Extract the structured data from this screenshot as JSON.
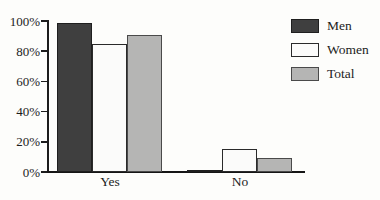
{
  "background_color": "#fdfdfb",
  "text_color": "#1c1c1c",
  "axis_color": "#1c1c1c",
  "chart_data": {
    "type": "bar",
    "title": "",
    "xlabel": "",
    "ylabel": "",
    "categories": [
      "Yes",
      "No"
    ],
    "series": [
      {
        "name": "Men",
        "values": [
          99,
          1
        ],
        "fill": "#3f3f3f",
        "border": "#1f1f1f"
      },
      {
        "name": "Women",
        "values": [
          85,
          15
        ],
        "fill": "#fbfbfa",
        "border": "#2a2a2a"
      },
      {
        "name": "Total",
        "values": [
          91,
          9
        ],
        "fill": "#b5b5b4",
        "border": "#4a4a4a"
      }
    ],
    "ylim": [
      0,
      100
    ],
    "yticks": [
      0,
      20,
      40,
      60,
      80,
      100
    ],
    "ytick_labels": [
      "0%",
      "20%",
      "40%",
      "60%",
      "80%",
      "100%"
    ],
    "grid": false,
    "legend_position": "top-right"
  }
}
